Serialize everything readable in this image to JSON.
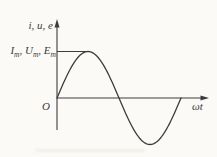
{
  "labels": {
    "y_axis": "i, u, e",
    "amplitude": {
      "terms": [
        {
          "base": "I",
          "sub": "m"
        },
        {
          "base": "U",
          "sub": "m"
        },
        {
          "base": "E",
          "sub": "m"
        }
      ],
      "separator": ", "
    },
    "origin": "O",
    "x_axis": "ωt"
  },
  "colors": {
    "ink": "#3c3c3c",
    "paper": "#fbfaf7"
  },
  "chart_data": {
    "type": "line",
    "title": "",
    "xlabel": "ωt",
    "ylabel": "i, u, e",
    "function": "y = sin(ωt)",
    "amplitude": 1,
    "amplitude_label": "Im, Um, Em",
    "x_range": [
      0,
      6.2832
    ],
    "key_points": {
      "x": [
        "0",
        "π/2",
        "π",
        "3π/2",
        "2π"
      ],
      "y": [
        0,
        1,
        0,
        -1,
        0
      ]
    },
    "grid": false,
    "legend": false
  }
}
